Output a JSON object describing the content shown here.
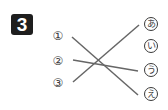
{
  "exercise": {
    "number": "3",
    "left_items": [
      {
        "label": "①",
        "x": 51,
        "y": 29
      },
      {
        "label": "②",
        "x": 51,
        "y": 54
      },
      {
        "label": "③",
        "x": 51,
        "y": 76
      }
    ],
    "right_items": [
      {
        "label": "ⓐ",
        "text": "あ",
        "x": 144,
        "y": 17
      },
      {
        "label": "ⓘ",
        "text": "い",
        "x": 144,
        "y": 39
      },
      {
        "label": "ⓤ",
        "text": "う",
        "x": 144,
        "y": 63
      },
      {
        "label": "ⓔ",
        "text": "え",
        "x": 144,
        "y": 87
      }
    ],
    "connections": [
      {
        "from": "①",
        "to": "え",
        "x1": 72,
        "y1": 37,
        "x2": 138,
        "y2": 95
      },
      {
        "from": "②",
        "to": "う",
        "x1": 73,
        "y1": 60,
        "x2": 138,
        "y2": 71
      },
      {
        "from": "③",
        "to": "あ",
        "x1": 73,
        "y1": 82,
        "x2": 139,
        "y2": 25
      }
    ],
    "line_color": "#666666"
  }
}
